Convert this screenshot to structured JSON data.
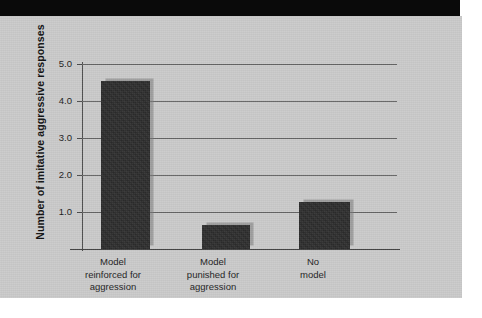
{
  "figure": {
    "background_color": "#c9c9c9",
    "header_band_color": "#0a0a0a",
    "bar_color": "#2b2b2b",
    "gridline_color": "#636363"
  },
  "chart_data": {
    "type": "bar",
    "title": "",
    "xlabel": "",
    "ylabel": "Number of imitative aggressive responses",
    "categories": [
      "Model reinforced for aggression",
      "Model punished for aggression",
      "No model"
    ],
    "category_lines": [
      [
        "Model",
        "reinforced for",
        "aggression"
      ],
      [
        "Model",
        "punished for",
        "aggression"
      ],
      [
        "No",
        "model"
      ]
    ],
    "values": [
      4.55,
      0.65,
      1.27
    ],
    "ylim": [
      0,
      5.0
    ],
    "yticks": [
      1.0,
      2.0,
      3.0,
      4.0,
      5.0
    ],
    "ytick_labels": [
      "1.0",
      "2.0",
      "3.0",
      "4.0",
      "5.0"
    ],
    "grid": true,
    "legend": "none"
  }
}
